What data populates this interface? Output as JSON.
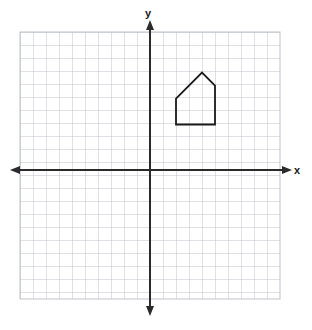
{
  "figure": {
    "type": "coordinate-plane",
    "background_color": "#ffffff",
    "grid_color": "#b9bcc4",
    "axis_color": "#2b2b2b",
    "shape_color": "#1a1a1a"
  },
  "axes": {
    "x_label": "x",
    "y_label": "y",
    "origin_px": {
      "x": 150,
      "y": 170
    },
    "unit_px": 13,
    "x_range": [
      -10,
      10
    ],
    "y_range": [
      -10,
      10
    ],
    "grid_visible": true,
    "tick_labels_visible": false,
    "arrowheads": [
      "left",
      "right",
      "up",
      "down"
    ]
  },
  "grid": {
    "left_px": 20,
    "top_px": 32,
    "right_px": 280,
    "bottom_px": 299,
    "cell_px": 13,
    "columns": 20,
    "rows": 20.5
  },
  "chart_data": {
    "type": "scatter",
    "title": "",
    "xlabel": "x",
    "ylabel": "y",
    "xlim": [
      -10,
      10
    ],
    "ylim": [
      -10,
      10
    ],
    "grid": true,
    "legend": "none",
    "series": [
      {
        "name": "pentagon-house",
        "closed": true,
        "points": [
          {
            "x": 2,
            "y": 3.5
          },
          {
            "x": 2,
            "y": 5.5
          },
          {
            "x": 4,
            "y": 7.5
          },
          {
            "x": 5,
            "y": 6.5
          },
          {
            "x": 5,
            "y": 3.5
          }
        ]
      }
    ]
  }
}
